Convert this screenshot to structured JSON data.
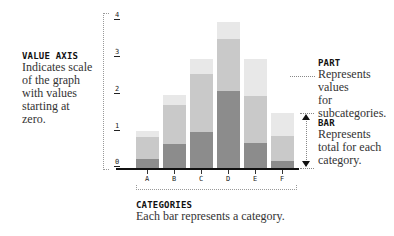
{
  "chart_data": {
    "type": "bar",
    "stacked": true,
    "categories": [
      "A",
      "B",
      "C",
      "D",
      "E",
      "F"
    ],
    "series": [
      {
        "name": "Part 1 (dark)",
        "color": "#8c8c8c",
        "values": [
          0.24,
          0.65,
          0.97,
          2.08,
          0.68,
          0.19
        ]
      },
      {
        "name": "Part 2 (medium)",
        "color": "#c9c9c9",
        "values": [
          0.6,
          1.05,
          1.57,
          1.42,
          1.27,
          0.67
        ]
      },
      {
        "name": "Part 3 (light)",
        "color": "#e8e8e8",
        "values": [
          0.16,
          0.27,
          0.41,
          0.45,
          1.0,
          0.63
        ]
      }
    ],
    "totals": [
      1.0,
      1.97,
      2.95,
      3.95,
      2.95,
      1.49
    ],
    "y_ticks": [
      "0",
      "1",
      "2",
      "3",
      "4"
    ],
    "ylim": [
      0,
      4
    ],
    "grid": false,
    "title": "",
    "xlabel": "",
    "ylabel": ""
  },
  "annotations": {
    "value_axis": {
      "title": "VALUE AXIS",
      "text": [
        "Indicates scale",
        "of the graph",
        "with values",
        "starting at",
        "zero."
      ]
    },
    "part": {
      "title": "PART",
      "text": [
        "Represents values",
        "for subcategories."
      ]
    },
    "bar": {
      "title": "BAR",
      "text": [
        "Represents",
        "total for each",
        "category."
      ]
    },
    "categories": {
      "title": "CATEGORIES",
      "text": [
        "Each bar represents a category."
      ]
    }
  }
}
